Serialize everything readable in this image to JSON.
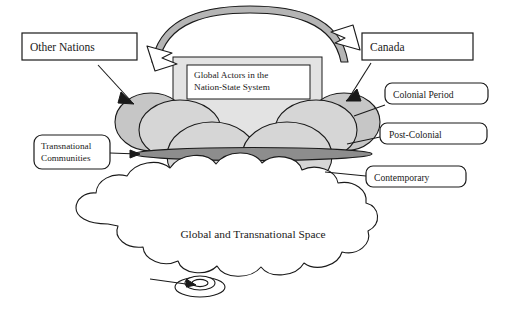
{
  "diagram": {
    "title_inner_box": "Global Actors in the\nNation-State System",
    "inner_box_line1": "Global Actors in the",
    "inner_box_line2": "Nation-State System",
    "cloud_label": "Global and Transnational Space",
    "boxes": [
      {
        "id": "other-nations",
        "label": "Other Nations",
        "shape": "rectangle"
      },
      {
        "id": "canada",
        "label": "Canada",
        "shape": "rectangle"
      }
    ],
    "callouts": [
      {
        "id": "colonial-period",
        "label": "Colonial Period",
        "shape": "rounded-rectangle",
        "side": "right"
      },
      {
        "id": "post-colonial",
        "label": "Post-Colonial",
        "shape": "rounded-rectangle",
        "side": "right"
      },
      {
        "id": "contemporary",
        "label": "Contemporary",
        "shape": "rounded-rectangle",
        "side": "right"
      },
      {
        "id": "transnational-communities",
        "label_line1": "Transnational",
        "label_line2": "Communities",
        "shape": "rounded-rectangle",
        "side": "left"
      }
    ],
    "icons": [
      {
        "name": "double-headed-arc-arrow-icon",
        "description": "curved double arrow spanning the top"
      },
      {
        "name": "cloud-icon",
        "description": "scalloped cloud outline at bottom"
      },
      {
        "name": "concentric-ellipse-node-icon",
        "description": "small target node at cloud bottom"
      }
    ],
    "colors": {
      "stroke": "#1a1a1a",
      "column_fill": "#e3e3e3",
      "ellipse_back_fill": "#c6c6c6",
      "ellipse_front_fill": "#d6d6d6",
      "lens_fill": "#8d8d8d",
      "arc_fill": "#b5b5b5",
      "page_background": "#ffffff",
      "box_fill": "#ffffff"
    }
  }
}
